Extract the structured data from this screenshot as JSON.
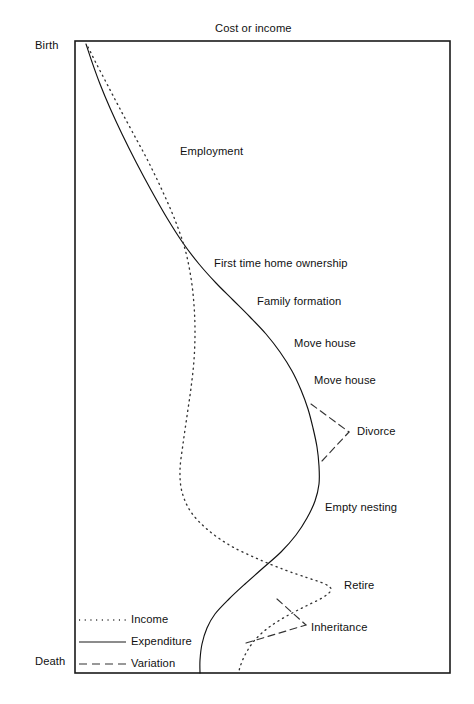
{
  "chart_data": {
    "type": "line",
    "title": "Cost or income",
    "xlabel": "Cost or income",
    "ylabel": "Life stage (Birth to Death)",
    "grid": false,
    "legend_position": "bottom-left inside plot",
    "axis_labels": {
      "y_top": "Birth",
      "y_bottom": "Death"
    },
    "x_axis_direction": "increasing cost or income to the right",
    "y_axis_direction": "time from Birth (top) to Death (bottom)",
    "series": [
      {
        "name": "Income",
        "style": "dotted",
        "points": [
          [
            88,
            47
          ],
          [
            96,
            63
          ],
          [
            107,
            84
          ],
          [
            119,
            107
          ],
          [
            133,
            133
          ],
          [
            148,
            161
          ],
          [
            162,
            190
          ],
          [
            175,
            220
          ],
          [
            185,
            249
          ],
          [
            191,
            278
          ],
          [
            194,
            305
          ],
          [
            195,
            332
          ],
          [
            194,
            360
          ],
          [
            191,
            388
          ],
          [
            187,
            416
          ],
          [
            183,
            444
          ],
          [
            180,
            470
          ],
          [
            182,
            492
          ],
          [
            191,
            512
          ],
          [
            208,
            530
          ],
          [
            231,
            546
          ],
          [
            258,
            559
          ],
          [
            285,
            570
          ],
          [
            308,
            578
          ],
          [
            325,
            584
          ],
          [
            331,
            590
          ],
          [
            322,
            598
          ],
          [
            304,
            607
          ],
          [
            285,
            617
          ],
          [
            268,
            628
          ],
          [
            254,
            641
          ],
          [
            245,
            655
          ],
          [
            240,
            667
          ],
          [
            239,
            673
          ]
        ]
      },
      {
        "name": "Expenditure",
        "style": "solid",
        "points": [
          [
            86,
            44
          ],
          [
            92,
            62
          ],
          [
            100,
            84
          ],
          [
            110,
            108
          ],
          [
            122,
            134
          ],
          [
            136,
            162
          ],
          [
            151,
            190
          ],
          [
            167,
            218
          ],
          [
            183,
            243
          ],
          [
            199,
            264
          ],
          [
            216,
            283
          ],
          [
            233,
            300
          ],
          [
            250,
            317
          ],
          [
            266,
            334
          ],
          [
            280,
            352
          ],
          [
            292,
            371
          ],
          [
            301,
            390
          ],
          [
            308,
            409
          ],
          [
            313,
            428
          ],
          [
            317,
            447
          ],
          [
            319,
            466
          ],
          [
            319,
            484
          ],
          [
            315,
            501
          ],
          [
            307,
            518
          ],
          [
            296,
            535
          ],
          [
            281,
            552
          ],
          [
            263,
            568
          ],
          [
            245,
            584
          ],
          [
            229,
            599
          ],
          [
            215,
            614
          ],
          [
            207,
            628
          ],
          [
            202,
            644
          ],
          [
            200,
            660
          ],
          [
            200,
            673
          ]
        ]
      }
    ],
    "variations": [
      {
        "name": "Divorce",
        "style": "dashed",
        "segments": [
          [
            [
              311,
              404
            ],
            [
              349,
              432
            ]
          ],
          [
            [
              322,
              461
            ],
            [
              349,
              432
            ]
          ]
        ],
        "apex": [
          349,
          432
        ]
      },
      {
        "name": "Inheritance",
        "style": "dashed",
        "segments": [
          [
            [
              277,
              599
            ],
            [
              306,
              625
            ]
          ],
          [
            [
              246,
              643
            ],
            [
              306,
              625
            ]
          ]
        ],
        "apex": [
          306,
          625
        ]
      }
    ],
    "annotations": [
      {
        "text": "Employment",
        "x": 180,
        "y": 152
      },
      {
        "text": "First time home ownership",
        "x": 215,
        "y": 264
      },
      {
        "text": "Family formation",
        "x": 258,
        "y": 302
      },
      {
        "text": "Move house",
        "x": 295,
        "y": 344
      },
      {
        "text": "Move house",
        "x": 315,
        "y": 381
      },
      {
        "text": "Divorce",
        "x": 357,
        "y": 432
      },
      {
        "text": "Empty nesting",
        "x": 326,
        "y": 508
      },
      {
        "text": "Retire",
        "x": 345,
        "y": 586
      },
      {
        "text": "Inheritance",
        "x": 311,
        "y": 628
      }
    ],
    "legend_entries": [
      {
        "label": "Income",
        "style": "dotted"
      },
      {
        "label": "Expenditure",
        "style": "solid"
      },
      {
        "label": "Variation",
        "style": "dashed"
      }
    ],
    "plot_box": {
      "x": 75,
      "y": 41,
      "width": 375,
      "height": 632
    }
  },
  "title": {
    "text": "Cost or income"
  },
  "axis": {
    "birth_label": "Birth",
    "death_label": "Death"
  },
  "annotations": {
    "employment": "Employment",
    "first_time_home_ownership": "First time home ownership",
    "family_formation": "Family formation",
    "move_house_1": "Move house",
    "move_house_2": "Move house",
    "divorce": "Divorce",
    "empty_nesting": "Empty nesting",
    "retire": "Retire",
    "inheritance": "Inheritance"
  },
  "legend": {
    "income": "Income",
    "expenditure": "Expenditure",
    "variation": "Variation"
  },
  "colors": {
    "ink": "#111111",
    "background": "#ffffff",
    "frame": "#1a1a1a"
  }
}
